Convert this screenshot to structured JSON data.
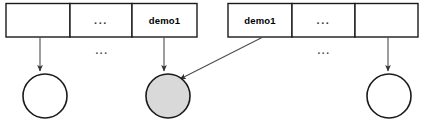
{
  "diagram": {
    "type": "two-table-pointer-diagram",
    "colors": {
      "stroke": "#1a1a1a",
      "cell_fill": "#ffffff",
      "highlight_fill": "#d9d9d9",
      "arrow": "#4d4d4d",
      "background": "#ffffff"
    },
    "left_table": {
      "name": "left-table",
      "cells": [
        {
          "label": "",
          "name": "left-cell-1"
        },
        {
          "label": "...",
          "name": "left-cell-ellipsis"
        },
        {
          "label": "demo1",
          "name": "left-cell-demo1"
        }
      ]
    },
    "right_table": {
      "name": "right-table",
      "cells": [
        {
          "label": "demo1",
          "name": "right-cell-demo1"
        },
        {
          "label": "...",
          "name": "right-cell-ellipsis"
        },
        {
          "label": "",
          "name": "right-cell-3"
        }
      ]
    },
    "ellipses": [
      {
        "label": "...",
        "name": "left-gap-ellipsis"
      },
      {
        "label": "...",
        "name": "right-gap-ellipsis"
      }
    ],
    "nodes": [
      {
        "name": "node-left",
        "fill": "#ffffff",
        "label": ""
      },
      {
        "name": "node-shared",
        "fill": "#d9d9d9",
        "label": ""
      },
      {
        "name": "node-right",
        "fill": "#ffffff",
        "label": ""
      }
    ],
    "edges": [
      {
        "name": "edge-left-cell1-to-node-left",
        "from": "left-cell-1",
        "to": "node-left"
      },
      {
        "name": "edge-left-demo1-to-node-shared",
        "from": "left-cell-demo1",
        "to": "node-shared"
      },
      {
        "name": "edge-right-demo1-to-node-shared",
        "from": "right-cell-demo1",
        "to": "node-shared"
      },
      {
        "name": "edge-right-cell3-to-node-right",
        "from": "right-cell-3",
        "to": "node-right"
      }
    ]
  }
}
